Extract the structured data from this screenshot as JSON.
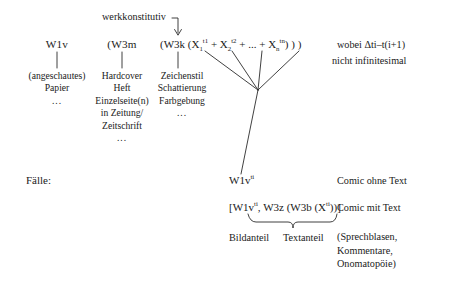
{
  "diagram": {
    "title_note": "werkkonstitutiv",
    "columns": [
      {
        "head": "W1v",
        "lines": [
          "(angeschautes)",
          "Papier",
          "..."
        ]
      },
      {
        "head": "(W3m",
        "lines": [
          "Hardcover",
          "Heft",
          "Einzelseite(n)",
          "in Zeitung/",
          "Zeitschrift",
          "..."
        ]
      },
      {
        "head_prefix": "(W3k (X",
        "head": "(W3k",
        "lines": [
          "Zeichenstil",
          "Schattierung",
          "Farbgebung",
          "..."
        ]
      }
    ],
    "formula": {
      "open": "(W3k (X",
      "term1_sub": "1",
      "term1_sup": "t1",
      "plus1": "+ X",
      "term2_sub": "2",
      "term2_sup": "t2",
      "plus2": "+ ... + X",
      "term3_sub": "n",
      "term3_sup": "tn",
      "close": ") ) )"
    },
    "side_note": {
      "line1": "wobei Δti–t(i+1)",
      "line2": "nicht infinitesimal"
    },
    "cases": {
      "label": "Fälle:",
      "case1": {
        "formula_base": "W1v",
        "formula_sup": "ti",
        "caption": "Comic ohne Text"
      },
      "case2": {
        "f_open": "[W1v",
        "f_sup1": "ti",
        "f_mid": ", W3z (W3b (X",
        "f_sup2": "ti",
        "f_close": "))]",
        "caption": "Comic mit Text"
      },
      "brace_labels": {
        "left": "Bildanteil",
        "right": "Textanteil"
      },
      "note": {
        "line1": "(Sprechblasen,",
        "line2": "Kommentare,",
        "line3": "Onomatopöie)"
      }
    }
  },
  "colors": {
    "ink": "#1a1a1a",
    "background": "#ffffff",
    "rule": "#2b2b2b"
  }
}
